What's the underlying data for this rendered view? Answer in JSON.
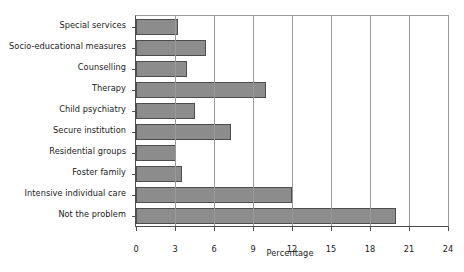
{
  "chart_data": {
    "type": "bar",
    "orientation": "horizontal",
    "title": "",
    "xlabel": "Percentage",
    "ylabel": "",
    "xlim": [
      0,
      24
    ],
    "xticks": [
      0,
      3,
      6,
      9,
      12,
      15,
      18,
      21,
      24
    ],
    "grid": "vertical",
    "legend": "none",
    "categories": [
      "Special services",
      "Socio-educational measures",
      "Counselling",
      "Therapy",
      "Child psychiatry",
      "Secure institution",
      "Residential groups",
      "Foster family",
      "Intensive individual care",
      "Not the problem"
    ],
    "values": [
      3.2,
      5.4,
      3.9,
      10.0,
      4.5,
      7.3,
      3.1,
      3.5,
      12.0,
      20.0
    ],
    "bar_color": "#8c8c8c",
    "bar_edge_color": "#4d4d4d",
    "axis_color": "#4d4d4d",
    "grid_color": "#999999"
  },
  "axis": {
    "x_title": "Percentage",
    "tick_labels": [
      "0",
      "3",
      "6",
      "9",
      "12",
      "15",
      "18",
      "21",
      "24"
    ]
  }
}
